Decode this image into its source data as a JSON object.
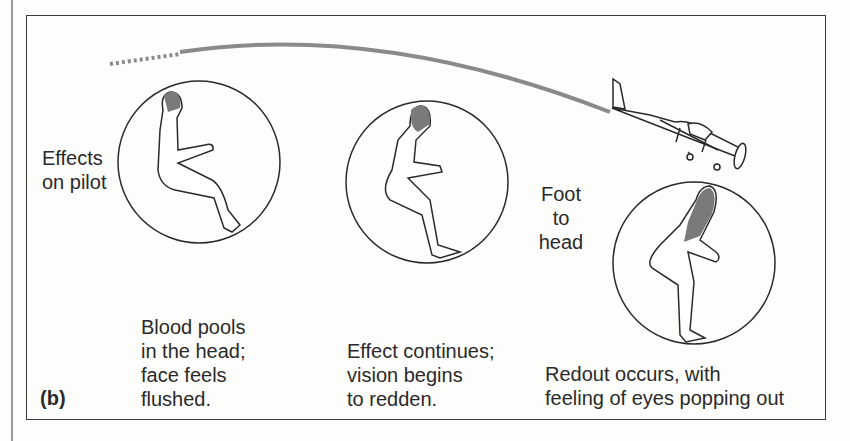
{
  "figure": {
    "panel_label": "(b)",
    "side_label": "Effects\non pilot",
    "direction_label": "Foot\nto\nhead",
    "stages": [
      {
        "caption": "Blood pools\nin the head;\nface feels\nflushed."
      },
      {
        "caption": "Effect continues;\nvision begins\nto redden."
      },
      {
        "caption": "Redout occurs, with\nfeeling of eyes popping out"
      }
    ],
    "colors": {
      "line": "#2a2a2a",
      "blood": "#7a7a7a",
      "trail": "#8a8a8a",
      "frame": "#3a3a3a"
    }
  }
}
